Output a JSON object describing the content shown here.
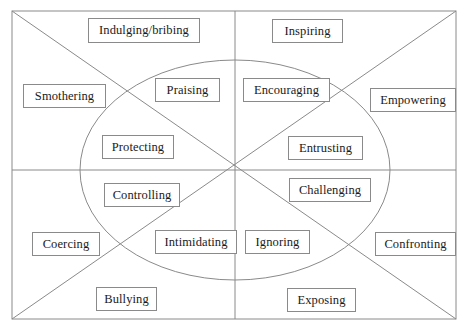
{
  "diagram": {
    "type": "quadrant-matrix-with-ellipse",
    "frame": {
      "x": 12,
      "y": 11,
      "width": 444,
      "height": 308,
      "stroke": "#8a8a8a"
    },
    "ellipse": {
      "cx": 235,
      "cy": 170,
      "rx": 155,
      "ry": 110,
      "stroke": "#8a8a8a"
    },
    "axes": {
      "horizontal": {
        "x1": 12,
        "y1": 170,
        "x2": 456,
        "y2": 170
      },
      "vertical": {
        "x1": 235,
        "y1": 11,
        "x2": 235,
        "y2": 319
      },
      "diagonal_tl_br": {
        "x1": 12,
        "y1": 11,
        "x2": 456,
        "y2": 319
      },
      "diagonal_bl_tr": {
        "x1": 12,
        "y1": 319,
        "x2": 456,
        "y2": 11
      }
    },
    "colors": {
      "line": "#8a8a8a",
      "box_border": "#8a8a8a",
      "text": "#1a1a1a",
      "background": "#ffffff"
    },
    "nodes": [
      {
        "id": "indulging-bribing",
        "label": "Indulging/bribing",
        "x": 88,
        "y": 18,
        "width": 112,
        "height": 25
      },
      {
        "id": "inspiring",
        "label": "Inspiring",
        "x": 272,
        "y": 19,
        "width": 71,
        "height": 24
      },
      {
        "id": "smothering",
        "label": "Smothering",
        "x": 23,
        "y": 84,
        "width": 83,
        "height": 24
      },
      {
        "id": "praising",
        "label": "Praising",
        "x": 155,
        "y": 78,
        "width": 65,
        "height": 24
      },
      {
        "id": "encouraging",
        "label": "Encouraging",
        "x": 243,
        "y": 78,
        "width": 87,
        "height": 24
      },
      {
        "id": "empowering",
        "label": "Empowering",
        "x": 370,
        "y": 88,
        "width": 86,
        "height": 24
      },
      {
        "id": "protecting",
        "label": "Protecting",
        "x": 102,
        "y": 135,
        "width": 72,
        "height": 24
      },
      {
        "id": "entrusting",
        "label": "Entrusting",
        "x": 288,
        "y": 136,
        "width": 75,
        "height": 24
      },
      {
        "id": "controlling",
        "label": "Controlling",
        "x": 104,
        "y": 183,
        "width": 76,
        "height": 24
      },
      {
        "id": "challenging",
        "label": "Challenging",
        "x": 289,
        "y": 178,
        "width": 82,
        "height": 24
      },
      {
        "id": "coercing",
        "label": "Coercing",
        "x": 32,
        "y": 232,
        "width": 68,
        "height": 24
      },
      {
        "id": "intimidating",
        "label": "Intimidating",
        "x": 155,
        "y": 230,
        "width": 82,
        "height": 24
      },
      {
        "id": "ignoring",
        "label": "Ignoring",
        "x": 245,
        "y": 230,
        "width": 65,
        "height": 24
      },
      {
        "id": "confronting",
        "label": "Confronting",
        "x": 375,
        "y": 232,
        "width": 81,
        "height": 24
      },
      {
        "id": "bullying",
        "label": "Bullying",
        "x": 96,
        "y": 287,
        "width": 61,
        "height": 24
      },
      {
        "id": "exposing",
        "label": "Exposing",
        "x": 287,
        "y": 288,
        "width": 69,
        "height": 24
      }
    ]
  }
}
